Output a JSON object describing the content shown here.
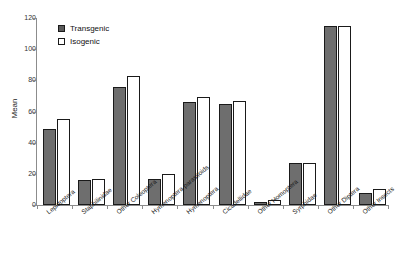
{
  "chart_data": {
    "type": "bar",
    "title": "",
    "xlabel": "",
    "ylabel": "Mean",
    "ylim": [
      0,
      120
    ],
    "yticks": [
      0,
      20,
      40,
      60,
      80,
      100,
      120
    ],
    "grid": false,
    "legend_position": "top-left",
    "categories": [
      "Lepidoptera",
      "Staphilinidae",
      "Other Coleoptera",
      "Hymenoptera parasitoids",
      "Hymenoptera",
      "Cicadellidae",
      "Other Homoptera",
      "Syrphidae",
      "Other Diptera",
      "Other Insects"
    ],
    "series": [
      {
        "name": "Transgenic",
        "color": "#6e6e6e",
        "values": [
          49,
          16,
          76,
          17,
          66,
          65,
          2,
          27,
          115,
          8
        ]
      },
      {
        "name": "Isogenic",
        "color": "#ffffff",
        "values": [
          55,
          17,
          83,
          20,
          69,
          67,
          3,
          27,
          115,
          10
        ]
      }
    ]
  },
  "legend": {
    "items": [
      {
        "label": "Transgenic",
        "swatch": "filled-square-icon"
      },
      {
        "label": "Isogenic",
        "swatch": "open-square-icon"
      }
    ]
  },
  "axes": {
    "y_title": "Mean",
    "y_tick_labels": [
      "120",
      "100",
      "80",
      "60",
      "40",
      "20",
      "0"
    ]
  }
}
